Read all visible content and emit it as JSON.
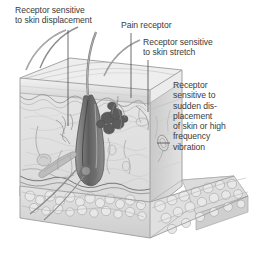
{
  "figure": {
    "background_color": "#ffffff",
    "ink_color": "#3a3a3a",
    "labels": [
      {
        "id": "displacement",
        "text": "Receptor sensitive\nto skin displacement",
        "target": "hair-follicle-receptor"
      },
      {
        "id": "pain",
        "text": "Pain receptor",
        "target": "free-nerve-ending"
      },
      {
        "id": "stretch",
        "text": "Receptor sensitive\nto skin stretch",
        "target": "ruffini-ending"
      },
      {
        "id": "vibration",
        "text": "Receptor\nsensitive to\nsudden dis-\nplacement\nof skin or high\nfrequency\nvibration",
        "target": "pacinian-corpuscle"
      }
    ],
    "structures": [
      "hair-shaft",
      "epidermis",
      "dermis",
      "hair-follicle",
      "sebaceous-gland",
      "arrector-pili-muscle",
      "subcutaneous-fat",
      "nerve-fibers",
      "pacinian-corpuscle",
      "ruffini-ending",
      "free-nerve-ending"
    ],
    "palette": {
      "skin_light": "#e9e9e9",
      "skin_mid": "#d2d2d2",
      "skin_dark": "#b4b4b4",
      "fat_light": "#ededed",
      "fat_mid": "#d6d6d6",
      "follicle_dark": "#6e6e6e",
      "line": "#8a8a8a",
      "leader": "#4a4a4a"
    }
  }
}
